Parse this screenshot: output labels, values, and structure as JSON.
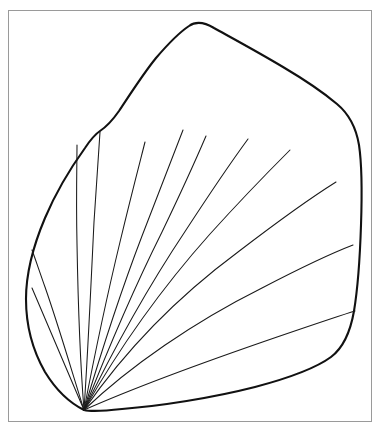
{
  "figure": {
    "title": "Palmate fan-shaped leaf outline drawing",
    "caption": "",
    "background_color": "#ffffff",
    "frame": {
      "visible": true,
      "color": "#9a9a9a",
      "stroke_width": 1,
      "x": 8,
      "y": 10,
      "width": 364,
      "height": 412
    },
    "canvas": {
      "width": 381,
      "height": 430
    }
  },
  "drawing": {
    "type": "line-drawing",
    "subject": "leaf",
    "outline_color": "#111111",
    "outline_width": 2.1,
    "vein_color": "#1a1a1a",
    "vein_width": 1.05,
    "fill_color": "#ffffff",
    "base_point": {
      "x": 84,
      "y": 410
    },
    "top_apex": {
      "x": 188,
      "y": 26
    },
    "left_notch": {
      "x": 100,
      "y": 131
    },
    "outline_path": "M 84 410 C 70 403 56 390 45 372 C 33 351 26 325 26 299 C 26 270 34 244 45 218 C 56 192 72 166 85 148 C 93 136 97 133 100 131 C 106 127 112 121 119 111 C 131 93 143 74 156 58 C 168 44 180 32 189 26 C 196 21 204 22 214 28 C 232 38 258 52 283 67 C 305 80 324 93 337 104 C 349 114 356 127 359 145 C 362 165 362 196 361 225 C 360 256 358 287 354 311 C 350 334 343 348 331 357 C 316 368 289 378 255 387 C 212 398 160 406 122 409 C 104 411 92 412 84 410 Z",
    "veins": [
      {
        "id": "vein-1",
        "label": "leftmost-vein",
        "path": "M 84 410 L 32 288"
      },
      {
        "id": "vein-2",
        "label": "vein-2",
        "path": "M 84 410 C 72 372 59 327 45 287 C 39 270 35 258 32 250"
      },
      {
        "id": "vein-3",
        "label": "vein-3",
        "path": "M 84 410 C 80 360 78 300 77 244 C 76 198 77 160 77 145"
      },
      {
        "id": "vein-4",
        "label": "vein-vertical-notch",
        "path": "M 84 410 C 88 352 91 284 94 222 C 97 174 99 146 100 132"
      },
      {
        "id": "vein-5",
        "label": "vein-5",
        "path": "M 84 410 C 94 358 106 300 120 242 C 132 192 141 158 145 142"
      },
      {
        "id": "vein-6",
        "label": "vein-6",
        "path": "M 84 410 C 100 356 119 296 142 236 C 162 184 176 148 183 130"
      },
      {
        "id": "vein-7",
        "label": "vein-central",
        "path": "M 84 410 C 106 354 132 292 162 232 C 186 182 200 150 206 136"
      },
      {
        "id": "vein-8",
        "label": "vein-8",
        "path": "M 84 410 C 112 352 146 290 186 230 C 216 184 237 154 248 139"
      },
      {
        "id": "vein-9",
        "label": "vein-9",
        "path": "M 84 410 C 118 350 160 290 210 234 C 248 192 276 164 290 150"
      },
      {
        "id": "vein-10",
        "label": "vein-10",
        "path": "M 84 410 C 124 352 176 298 238 252 C 285 216 320 192 336 182"
      },
      {
        "id": "vein-11",
        "label": "vein-11",
        "path": "M 84 410 C 130 366 194 322 262 288 C 310 263 340 250 353 245"
      },
      {
        "id": "vein-12",
        "label": "vein-12",
        "path": "M 84 410 C 138 386 210 360 280 336 C 324 321 345 314 355 311"
      }
    ],
    "vein_count": 12,
    "top_endpoints": [
      {
        "x": 183,
        "y": 130
      },
      {
        "x": 248,
        "y": 139
      },
      {
        "x": 290,
        "y": 150
      }
    ],
    "right_endpoints": [
      {
        "x": 336,
        "y": 182
      },
      {
        "x": 353,
        "y": 245
      },
      {
        "x": 355,
        "y": 311
      }
    ]
  }
}
